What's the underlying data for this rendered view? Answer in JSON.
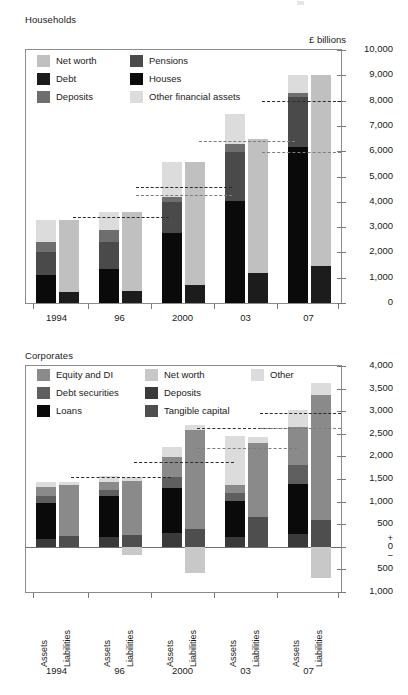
{
  "page": {
    "unit_label": "£ billions"
  },
  "households": {
    "title": "Households",
    "legend": [
      {
        "label": "Net worth",
        "color": "#c0c0c0"
      },
      {
        "label": "Debt",
        "color": "#1c1c1c"
      },
      {
        "label": "Deposits",
        "color": "#6e6e6e"
      },
      {
        "label": "Pensions",
        "color": "#4a4a4a"
      },
      {
        "label": "Houses",
        "color": "#0a0a0a"
      },
      {
        "label": "Other financial assets",
        "color": "#dcdcdc"
      }
    ],
    "y_ticks": [
      "10,000",
      "9,000",
      "8,000",
      "7,000",
      "6,000",
      "5,000",
      "4,000",
      "3,000",
      "2,000",
      "1,000",
      "0"
    ],
    "x_labels": [
      "1994",
      "96",
      "2000",
      "03",
      "07"
    ]
  },
  "corporates": {
    "title": "Corporates",
    "legend": [
      {
        "label": "Equity and DI",
        "color": "#8a8a8a"
      },
      {
        "label": "Debt securities",
        "color": "#5f5f5f"
      },
      {
        "label": "Loans",
        "color": "#0a0a0a"
      },
      {
        "label": "Net worth",
        "color": "#c8c8c8"
      },
      {
        "label": "Deposits",
        "color": "#3a3a3a"
      },
      {
        "label": "Tangible capital",
        "color": "#4e4e4e"
      },
      {
        "label": "Other",
        "color": "#dcdcdc"
      }
    ],
    "y_ticks": [
      "4,000",
      "3,500",
      "3,000",
      "2,500",
      "2,000",
      "1,500",
      "1,000",
      "500",
      "0",
      "500",
      "1,000"
    ],
    "plus_sign": "+",
    "minus_sign": "−",
    "x_group_labels": [
      "1994",
      "96",
      "2000",
      "03",
      "07"
    ],
    "bar_labels": [
      "Assets",
      "Liabilities"
    ]
  },
  "chart_data": [
    {
      "type": "bar",
      "id": "households",
      "title": "Households",
      "subtitle": "",
      "xlabel": "",
      "ylabel": "£ billions",
      "ylim": [
        0,
        10000
      ],
      "ytick_step": 1000,
      "grid": false,
      "legend_position": "top-left-inside",
      "stacked": true,
      "categories": [
        "1994",
        "96",
        "2000",
        "03",
        "07"
      ],
      "bar_pairs": [
        "Assets",
        "Liabilities"
      ],
      "assets_series": [
        {
          "name": "Houses",
          "color": "#0a0a0a",
          "values": [
            1100,
            1350,
            2750,
            4050,
            6150
          ]
        },
        {
          "name": "Pensions",
          "color": "#4a4a4a",
          "values": [
            900,
            1050,
            1250,
            1900,
            2000
          ]
        },
        {
          "name": "Deposits",
          "color": "#6e6e6e",
          "values": [
            420,
            480,
            180,
            320,
            170
          ]
        },
        {
          "name": "Other financial assets",
          "color": "#dcdcdc",
          "values": [
            880,
            720,
            1400,
            1200,
            680
          ]
        }
      ],
      "liabilities_series": [
        {
          "name": "Debt",
          "color": "#1c1c1c",
          "values": [
            450,
            480,
            720,
            1200,
            1450
          ]
        },
        {
          "name": "Net worth",
          "color": "#c0c0c0",
          "values": [
            2850,
            3120,
            4860,
            5270,
            7550
          ]
        }
      ],
      "annotation_lines": [
        {
          "label": "1996 marker",
          "category": "96",
          "value": 3400,
          "style": "dashed-bold"
        },
        {
          "label": "2000 marker a",
          "category": "2000",
          "value": 4600,
          "style": "dashed-bold"
        },
        {
          "label": "2000 marker b",
          "category": "2000",
          "value": 4250,
          "style": "dashed-thin"
        },
        {
          "label": "2003 marker",
          "category": "03",
          "value": 6400,
          "style": "dashed-thin"
        },
        {
          "label": "2007 marker a",
          "category": "07",
          "value": 8000,
          "style": "dashed-bold"
        },
        {
          "label": "2007 marker b",
          "category": "07",
          "value": 5950,
          "style": "dashed-thin"
        }
      ]
    },
    {
      "type": "bar",
      "id": "corporates",
      "title": "Corporates",
      "subtitle": "",
      "xlabel": "",
      "ylabel": "£ billions",
      "ylim": [
        -1000,
        4000
      ],
      "ytick_step": 500,
      "grid": false,
      "legend_position": "top-left-inside",
      "stacked": true,
      "categories": [
        "1994",
        "96",
        "2000",
        "03",
        "07"
      ],
      "bar_pairs": [
        "Assets",
        "Liabilities"
      ],
      "assets_series": [
        {
          "name": "Deposits",
          "color": "#3a3a3a",
          "values": [
            170,
            210,
            310,
            220,
            290
          ]
        },
        {
          "name": "Loans",
          "color": "#0a0a0a",
          "values": [
            790,
            920,
            1000,
            790,
            1090
          ]
        },
        {
          "name": "Debt securities",
          "color": "#5f5f5f",
          "values": [
            160,
            120,
            230,
            180,
            430
          ]
        },
        {
          "name": "Equity and DI",
          "color": "#8a8a8a",
          "values": [
            200,
            180,
            440,
            170,
            840
          ]
        },
        {
          "name": "Other",
          "color": "#dcdcdc",
          "values": [
            120,
            130,
            230,
            1100,
            370
          ]
        }
      ],
      "liabilities_series": [
        {
          "name": "Tangible capital",
          "color": "#4e4e4e",
          "values": [
            230,
            270,
            400,
            650,
            600
          ]
        },
        {
          "name": "Equity and DI",
          "color": "#8a8a8a",
          "values": [
            1140,
            1190,
            2180,
            1640,
            2750
          ]
        },
        {
          "name": "Other",
          "color": "#dcdcdc",
          "values": [
            60,
            80,
            110,
            130,
            280
          ]
        },
        {
          "name": "Net worth (negative)",
          "color": "#c8c8c8",
          "values": [
            0,
            -180,
            -570,
            0,
            -700
          ]
        }
      ],
      "annotation_lines": [
        {
          "label": "1996 marker",
          "category": "96",
          "value": 1540,
          "style": "dashed-bold"
        },
        {
          "label": "2000 marker",
          "category": "2000",
          "value": 1870,
          "style": "dashed-bold"
        },
        {
          "label": "2003 marker a",
          "category": "03",
          "value": 2630,
          "style": "dashed-bold"
        },
        {
          "label": "2003 marker b",
          "category": "03",
          "value": 2180,
          "style": "dashed-thin"
        },
        {
          "label": "2007 marker a",
          "category": "07",
          "value": 2970,
          "style": "dashed-bold"
        },
        {
          "label": "2007 marker b",
          "category": "07",
          "value": 2620,
          "style": "dashed-thin"
        }
      ]
    }
  ]
}
